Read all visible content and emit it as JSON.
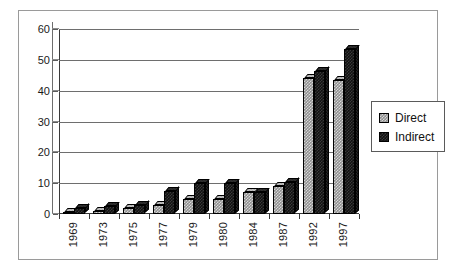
{
  "chart_data": {
    "type": "bar",
    "title": "",
    "subtitle": "",
    "xlabel": "",
    "ylabel": "",
    "categories": [
      "1969",
      "1973",
      "1975",
      "1977",
      "1979",
      "1980",
      "1984",
      "1987",
      "1992",
      "1997"
    ],
    "series": [
      {
        "name": "Direct",
        "color": "#8f8f8f",
        "values": [
          0.5,
          1,
          2,
          3,
          5,
          5,
          7,
          9,
          44,
          43.5
        ]
      },
      {
        "name": "Indirect",
        "color": "#101010",
        "values": [
          2,
          2.5,
          3,
          7.5,
          10,
          10,
          7,
          10.5,
          46.5,
          53.5
        ]
      }
    ],
    "ylim": [
      0,
      60
    ],
    "yticks": [
      0,
      10,
      20,
      30,
      40,
      50,
      60
    ],
    "ytick_labels": [
      "0",
      "10",
      "20",
      "30",
      "40",
      "50",
      "60"
    ],
    "grid": true,
    "grid_axis": "y",
    "legend": {
      "position": "right",
      "entries": [
        {
          "label": "Direct",
          "swatch": "direct"
        },
        {
          "label": "Indirect",
          "swatch": "indirect"
        }
      ]
    },
    "style": "3d-clustered-column",
    "xtick_label_rotation": 90
  }
}
